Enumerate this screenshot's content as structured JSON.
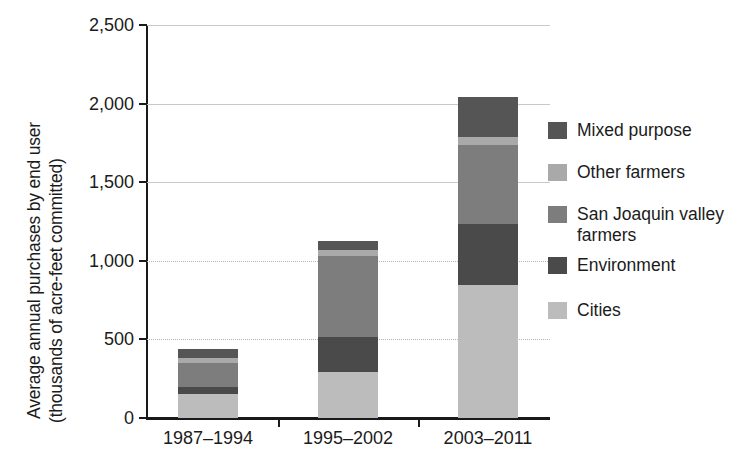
{
  "chart_data": {
    "type": "bar",
    "subtype": "stacked-vertical",
    "title": "",
    "xlabel": "",
    "ylabel": "Average annual purchases by end user (thousands of acre-feet committed)",
    "ylabel_lines": [
      "Average annual purchases by end user",
      "(thousands of acre-feet committed)"
    ],
    "categories": [
      "1987–1994",
      "1995–2002",
      "2003–2011"
    ],
    "ylim": [
      0,
      2500
    ],
    "yticks": [
      0,
      500,
      1000,
      1500,
      2000,
      2500
    ],
    "ytick_labels": [
      "0",
      "500",
      "1,000",
      "1,500",
      "2,000",
      "2,500"
    ],
    "grid": true,
    "legend_position": "right",
    "stack_order_bottom_to_top": [
      "Cities",
      "Environment",
      "San Joaquin valley farmers",
      "Other farmers",
      "Mixed purpose"
    ],
    "series": [
      {
        "name": "Cities",
        "color": "#bcbcbc",
        "values": [
          155,
          295,
          845
        ]
      },
      {
        "name": "Environment",
        "color": "#4a4a4a",
        "values": [
          40,
          220,
          390
        ]
      },
      {
        "name": "San Joaquin valley farmers",
        "color": "#7d7d7d",
        "values": [
          155,
          515,
          500
        ]
      },
      {
        "name": "Other farmers",
        "color": "#a9a9a9",
        "values": [
          30,
          40,
          50
        ]
      },
      {
        "name": "Mixed purpose",
        "color": "#555555",
        "values": [
          60,
          55,
          255
        ]
      }
    ],
    "totals": [
      440,
      1125,
      2040
    ]
  },
  "legend": {
    "entries": [
      {
        "label": "Mixed purpose",
        "color": "#555555"
      },
      {
        "label": "Other farmers",
        "color": "#a9a9a9"
      },
      {
        "label": "San Joaquin valley\nfarmers",
        "color": "#7d7d7d"
      },
      {
        "label": "Environment",
        "color": "#4a4a4a"
      },
      {
        "label": "Cities",
        "color": "#bcbcbc"
      }
    ]
  },
  "axis": {
    "y_tick_labels": [
      "2,500",
      "2,000",
      "1,500",
      "1,000",
      "500",
      "0"
    ],
    "x_tick_labels": [
      "1987–1994",
      "1995–2002",
      "2003–2011"
    ]
  },
  "colors": {
    "axis": "#1a1a1a",
    "grid": "#c9c9c9",
    "background": "#ffffff"
  }
}
